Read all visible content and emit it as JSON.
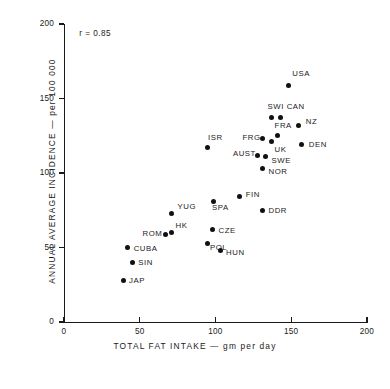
{
  "chart_data": {
    "type": "scatter",
    "title": "",
    "xlabel": "TOTAL FAT INTAKE  —  gm per day",
    "ylabel": "ANNUAL AVERAGE INCIDENCE  —  per 100 000",
    "xlim": [
      0,
      200
    ],
    "ylim": [
      0,
      200
    ],
    "xticks": [
      0,
      50,
      100,
      150,
      200
    ],
    "yticks": [
      0,
      50,
      100,
      150,
      200
    ],
    "xtick_labels": [
      "0",
      "50",
      "100",
      "150",
      "200"
    ],
    "ytick_labels": [
      "0",
      "50",
      "100",
      "150",
      "200"
    ],
    "grid": false,
    "legend": "none",
    "annotations": [
      {
        "text": "r = 0.85",
        "x": 10,
        "y": 193
      }
    ],
    "marker_color": "#111111",
    "axis_color": "#1a1a1a",
    "points": [
      {
        "label": "USA",
        "x": 148,
        "y": 159,
        "label_dx": 4,
        "label_dy": -12
      },
      {
        "label": "SWI",
        "x": 137,
        "y": 137,
        "label_dx": -4,
        "label_dy": -12
      },
      {
        "label": "CAN",
        "x": 143,
        "y": 137,
        "label_dx": 6,
        "label_dy": -12
      },
      {
        "label": "NZ",
        "x": 155,
        "y": 132,
        "label_dx": 7,
        "label_dy": -4
      },
      {
        "label": "FRA",
        "x": 141,
        "y": 125,
        "label_dx": -3,
        "label_dy": -11
      },
      {
        "label": "FRG",
        "x": 131,
        "y": 123,
        "label_dx": -20,
        "label_dy": -2
      },
      {
        "label": "UK",
        "x": 137,
        "y": 121,
        "label_dx": 3,
        "label_dy": 7
      },
      {
        "label": "DEN",
        "x": 157,
        "y": 119,
        "label_dx": 7,
        "label_dy": -1
      },
      {
        "label": "ISR",
        "x": 95,
        "y": 117,
        "label_dx": 0,
        "label_dy": -11
      },
      {
        "label": "AUST",
        "x": 128,
        "y": 112,
        "label_dx": -25,
        "label_dy": -2
      },
      {
        "label": "SWE",
        "x": 133,
        "y": 111,
        "label_dx": 6,
        "label_dy": 3
      },
      {
        "label": "NOR",
        "x": 131,
        "y": 103,
        "label_dx": 6,
        "label_dy": 2
      },
      {
        "label": "FIN",
        "x": 116,
        "y": 84,
        "label_dx": 6,
        "label_dy": -3
      },
      {
        "label": "SPA",
        "x": 99,
        "y": 81,
        "label_dx": -2,
        "label_dy": 6
      },
      {
        "label": "DDR",
        "x": 131,
        "y": 75,
        "label_dx": 6,
        "label_dy": 0
      },
      {
        "label": "YUG",
        "x": 71,
        "y": 73,
        "label_dx": 6,
        "label_dy": -7
      },
      {
        "label": "HK",
        "x": 71,
        "y": 60,
        "label_dx": 4,
        "label_dy": -8
      },
      {
        "label": "ROM",
        "x": 67,
        "y": 59,
        "label_dx": -23,
        "label_dy": -1
      },
      {
        "label": "CZE",
        "x": 98,
        "y": 62,
        "label_dx": 6,
        "label_dy": 0
      },
      {
        "label": "POL",
        "x": 95,
        "y": 53,
        "label_dx": 2,
        "label_dy": 4
      },
      {
        "label": "HUN",
        "x": 103,
        "y": 48,
        "label_dx": 6,
        "label_dy": 2
      },
      {
        "label": "CUBA",
        "x": 42,
        "y": 50,
        "label_dx": 6,
        "label_dy": 0
      },
      {
        "label": "SIN",
        "x": 45,
        "y": 40,
        "label_dx": 6,
        "label_dy": 0
      },
      {
        "label": "JAP",
        "x": 39,
        "y": 28,
        "label_dx": 6,
        "label_dy": 0
      }
    ]
  }
}
